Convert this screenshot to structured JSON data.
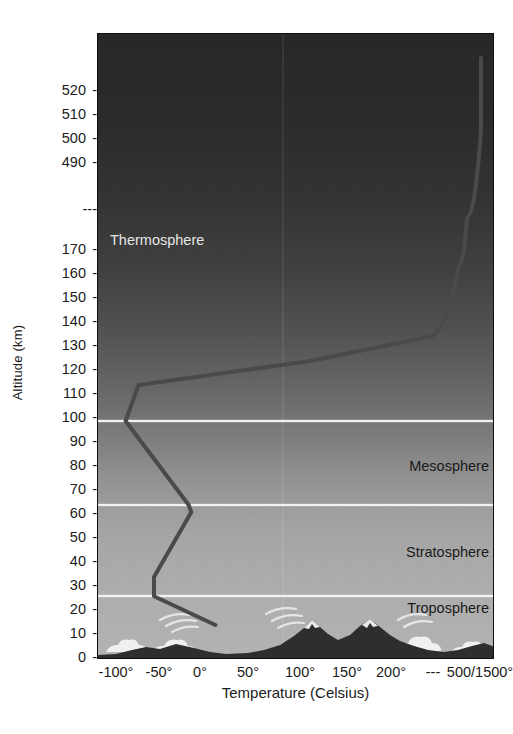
{
  "chart_data": {
    "type": "line",
    "title": "",
    "xlabel": "Temperature (Celsius)",
    "ylabel": "Altitude (km)",
    "x_tick_labels": [
      "-100°",
      "-50°",
      "0°",
      "50°",
      "100°",
      "150°",
      "200°",
      "---",
      "500/1500°"
    ],
    "x_tick_values": [
      -100,
      -50,
      0,
      50,
      100,
      150,
      200,
      350,
      500
    ],
    "y_tick_labels": [
      "520",
      "510",
      "500",
      "490",
      "---",
      "170",
      "160",
      "150",
      "140",
      "130",
      "120",
      "110",
      "100",
      "90",
      "80",
      "70",
      "60",
      "50",
      "40",
      "30",
      "20",
      "10",
      "0"
    ],
    "y_axis_has_break": true,
    "x_axis_has_break": true,
    "grid": false,
    "legend": "none",
    "series": [
      {
        "name": "Temperature profile",
        "color": "#4a4a4a",
        "points": [
          {
            "altitude_km": 0,
            "temperature_c": 15
          },
          {
            "altitude_km": 12,
            "temperature_c": -57
          },
          {
            "altitude_km": 20,
            "temperature_c": -57
          },
          {
            "altitude_km": 47,
            "temperature_c": -12
          },
          {
            "altitude_km": 50,
            "temperature_c": -15
          },
          {
            "altitude_km": 85,
            "temperature_c": -90
          },
          {
            "altitude_km": 100,
            "temperature_c": -75
          },
          {
            "altitude_km": 110,
            "temperature_c": 110
          },
          {
            "altitude_km": 120,
            "temperature_c": 330
          },
          {
            "altitude_km": 150,
            "temperature_c": 440
          },
          {
            "altitude_km": 170,
            "temperature_c": 470
          },
          {
            "altitude_km": 490,
            "temperature_c": 520
          },
          {
            "altitude_km": 520,
            "temperature_c": 530
          }
        ]
      }
    ],
    "layers": [
      {
        "name": "Troposphere",
        "lower_km": 0,
        "upper_km": 12,
        "label_color": "dark"
      },
      {
        "name": "Stratosphere",
        "lower_km": 12,
        "upper_km": 50,
        "label_color": "dark"
      },
      {
        "name": "Mesosphere",
        "lower_km": 50,
        "upper_km": 85,
        "label_color": "dark"
      },
      {
        "name": "Thermosphere",
        "lower_km": 85,
        "upper_km": 520,
        "label_color": "light"
      }
    ],
    "boundary_altitudes_km": [
      12,
      50,
      85
    ],
    "annotations": [
      "mountain-silhouette",
      "clouds",
      "cirrus-clouds"
    ]
  },
  "y_axis": {
    "title": "Altitude (km)",
    "ticks": [
      {
        "label": "520",
        "y": 57
      },
      {
        "label": "510",
        "y": 81
      },
      {
        "label": "500",
        "y": 105
      },
      {
        "label": "490",
        "y": 129
      },
      {
        "label": "---",
        "y": 176
      },
      {
        "label": "170",
        "y": 216
      },
      {
        "label": "160",
        "y": 240
      },
      {
        "label": "150",
        "y": 264
      },
      {
        "label": "140",
        "y": 288
      },
      {
        "label": "130",
        "y": 312
      },
      {
        "label": "120",
        "y": 336
      },
      {
        "label": "110",
        "y": 360
      },
      {
        "label": "100",
        "y": 384
      },
      {
        "label": "90",
        "y": 408
      },
      {
        "label": "80",
        "y": 432
      },
      {
        "label": "70",
        "y": 456
      },
      {
        "label": "60",
        "y": 480
      },
      {
        "label": "50",
        "y": 504
      },
      {
        "label": "40",
        "y": 528
      },
      {
        "label": "30",
        "y": 552
      },
      {
        "label": "20",
        "y": 576
      },
      {
        "label": "10",
        "y": 600
      },
      {
        "label": "0",
        "y": 624
      }
    ]
  },
  "x_axis": {
    "title": "Temperature (Celsius)",
    "ticks": [
      {
        "label": "-100°",
        "x": 19
      },
      {
        "label": "-50°",
        "x": 62
      },
      {
        "label": "0°",
        "x": 103
      },
      {
        "label": "50°",
        "x": 151
      },
      {
        "label": "100°",
        "x": 203
      },
      {
        "label": "150°",
        "x": 250
      },
      {
        "label": "200°",
        "x": 294
      },
      {
        "label": "---",
        "x": 336
      },
      {
        "label": "500/1500°",
        "x": 383
      }
    ]
  },
  "layer_labels": {
    "thermosphere": "Thermosphere",
    "mesosphere": "Mesosphere",
    "stratosphere": "Stratosphere",
    "troposphere": "Troposphere"
  },
  "colors": {
    "curve": "#4a4a4a",
    "boundary_line": "#f2f2f2",
    "frame": "#0f0f0f",
    "text": "#1b1b1b",
    "light_text": "#e6e6e6",
    "page_background": "#ffffff"
  }
}
